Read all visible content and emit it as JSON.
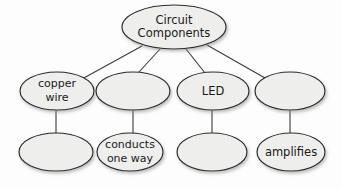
{
  "diagram": {
    "type": "concept-map",
    "background_color": "#fdfdfd",
    "node_fill_color": "#eeeeec",
    "node_stroke_color": "#2b2b2b",
    "edge_color": "#3a3a3a",
    "text_color": "#1a1a1a",
    "nodes": [
      {
        "id": "root",
        "label_lines": [
          "Circuit",
          "Components"
        ],
        "line1": "Circuit",
        "line2": "Components",
        "cx": 174,
        "cy": 27,
        "rx": 52,
        "ry": 22,
        "font_size": 11.5,
        "empty": false
      },
      {
        "id": "mid-1",
        "label_lines": [
          "copper",
          "wire"
        ],
        "line1": "copper",
        "line2": "wire",
        "cx": 57,
        "cy": 91,
        "rx": 37,
        "ry": 19,
        "font_size": 11,
        "empty": false
      },
      {
        "id": "mid-2",
        "label_lines": [],
        "line1": "",
        "line2": "",
        "cx": 133,
        "cy": 91,
        "rx": 37,
        "ry": 19,
        "font_size": 11,
        "empty": true
      },
      {
        "id": "mid-3",
        "label_lines": [
          "LED"
        ],
        "line1": "LED",
        "line2": "",
        "cx": 213,
        "cy": 91,
        "rx": 36,
        "ry": 19,
        "font_size": 11.5,
        "empty": false
      },
      {
        "id": "mid-4",
        "label_lines": [],
        "line1": "",
        "line2": "",
        "cx": 290,
        "cy": 91,
        "rx": 35,
        "ry": 19,
        "font_size": 11,
        "empty": true
      },
      {
        "id": "leaf-1",
        "label_lines": [],
        "line1": "",
        "line2": "",
        "cx": 56,
        "cy": 152,
        "rx": 37,
        "ry": 19,
        "font_size": 11,
        "empty": true
      },
      {
        "id": "leaf-2",
        "label_lines": [
          "conducts",
          "one way"
        ],
        "line1": "conducts",
        "line2": "one way",
        "cx": 130,
        "cy": 152,
        "rx": 33,
        "ry": 19,
        "font_size": 11,
        "empty": false
      },
      {
        "id": "leaf-3",
        "label_lines": [],
        "line1": "",
        "line2": "",
        "cx": 212,
        "cy": 152,
        "rx": 35,
        "ry": 19,
        "font_size": 11,
        "empty": true
      },
      {
        "id": "leaf-4",
        "label_lines": [
          "amplifies"
        ],
        "line1": "amplifies",
        "line2": "",
        "cx": 291,
        "cy": 152,
        "rx": 34,
        "ry": 19,
        "font_size": 11.5,
        "empty": false
      }
    ],
    "edges": [
      {
        "id": "edge-root-mid1",
        "from": "root",
        "to": "mid-1",
        "x1": 142,
        "y1": 46,
        "x2": 82,
        "y2": 79
      },
      {
        "id": "edge-root-mid2",
        "from": "root",
        "to": "mid-2",
        "x1": 160,
        "y1": 49,
        "x2": 139,
        "y2": 72
      },
      {
        "id": "edge-root-mid3",
        "from": "root",
        "to": "mid-3",
        "x1": 186,
        "y1": 49,
        "x2": 205,
        "y2": 73
      },
      {
        "id": "edge-root-mid4",
        "from": "root",
        "to": "mid-4",
        "x1": 207,
        "y1": 45,
        "x2": 265,
        "y2": 78
      },
      {
        "id": "edge-mid1-leaf1",
        "from": "mid-1",
        "to": "leaf-1",
        "x1": 56,
        "y1": 110,
        "x2": 56,
        "y2": 133
      },
      {
        "id": "edge-mid2-leaf2",
        "from": "mid-2",
        "to": "leaf-2",
        "x1": 133,
        "y1": 110,
        "x2": 133,
        "y2": 133
      },
      {
        "id": "edge-mid3-leaf3",
        "from": "mid-3",
        "to": "leaf-3",
        "x1": 212,
        "y1": 110,
        "x2": 212,
        "y2": 133
      },
      {
        "id": "edge-mid4-leaf4",
        "from": "mid-4",
        "to": "leaf-4",
        "x1": 290,
        "y1": 110,
        "x2": 290,
        "y2": 133
      }
    ]
  }
}
